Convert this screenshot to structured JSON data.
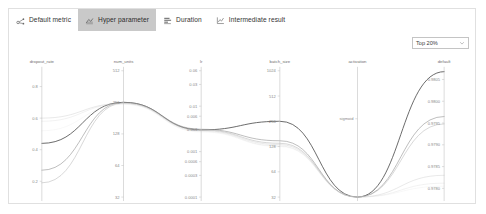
{
  "tabs": [
    {
      "label": "Default metric",
      "icon": "scatter-metric-icon",
      "selected": false
    },
    {
      "label": "Hyper parameter",
      "icon": "parallel-coordinates-icon",
      "selected": true
    },
    {
      "label": "Duration",
      "icon": "bar-duration-icon",
      "selected": false
    },
    {
      "label": "Intermediate result",
      "icon": "line-intermediate-icon",
      "selected": false
    }
  ],
  "filter": {
    "value": "Top 20%",
    "icon": "chevron-down-icon"
  },
  "chart_data": {
    "type": "line",
    "subtype": "parallel-coordinates",
    "title": "",
    "grid": false,
    "legend": null,
    "axes": [
      {
        "name": "dropout_rate",
        "scale": "linear",
        "ticks": [
          "0.8",
          "0.6",
          "0.4",
          "0.2"
        ],
        "tick_values": [
          0.8,
          0.6,
          0.4,
          0.2
        ],
        "range": [
          0.1,
          0.9
        ]
      },
      {
        "name": "num_units",
        "scale": "log2",
        "ticks": [
          "512",
          "256",
          "128",
          "64",
          "32"
        ],
        "tick_values": [
          512,
          256,
          128,
          64,
          32
        ],
        "range": [
          32,
          512
        ]
      },
      {
        "name": "lr",
        "scale": "log",
        "ticks": [
          "0.06",
          "0.03",
          "0.01",
          "0.006",
          "0.003",
          "0.001",
          "0.0006",
          "0.0003",
          "0.0001"
        ],
        "tick_values": [
          0.06,
          0.03,
          0.01,
          0.006,
          0.003,
          0.001,
          0.0006,
          0.0003,
          0.0001
        ],
        "range": [
          0.0001,
          0.06
        ]
      },
      {
        "name": "batch_size",
        "scale": "log2",
        "ticks": [
          "1024",
          "512",
          "256",
          "128",
          "64",
          "32"
        ],
        "tick_values": [
          1024,
          512,
          256,
          128,
          64,
          32
        ],
        "range": [
          32,
          1024
        ]
      },
      {
        "name": "activation",
        "scale": "category",
        "ticks": [
          "sigmoid"
        ],
        "categories": [
          "sigmoid"
        ],
        "range": [
          0,
          1
        ]
      },
      {
        "name": "default",
        "scale": "linear",
        "ticks": [
          "0.9805",
          "0.9800",
          "0.9795",
          "0.9790",
          "0.9785",
          "0.9780"
        ],
        "tick_values": [
          0.9805,
          0.98,
          0.9795,
          0.979,
          0.9785,
          0.978
        ],
        "range": [
          0.9778,
          0.9807
        ]
      }
    ],
    "series": [
      {
        "name": "trial-1",
        "shade": "#555555",
        "opacity": 0.92,
        "width": 0.95,
        "values": [
          0.44,
          256,
          0.003,
          256,
          "sigmoid",
          0.98068
        ]
      },
      {
        "name": "trial-2",
        "shade": "#8d8d8d",
        "opacity": 0.72,
        "width": 0.8,
        "values": [
          0.27,
          256,
          0.0031,
          150,
          "sigmoid",
          0.97965
        ]
      },
      {
        "name": "trial-3",
        "shade": "#a8a8a8",
        "opacity": 0.6,
        "width": 0.75,
        "values": [
          0.19,
          252,
          0.003,
          140,
          "sigmoid",
          0.97948
        ]
      },
      {
        "name": "trial-4",
        "shade": "#c0c0c0",
        "opacity": 0.5,
        "width": 0.7,
        "values": [
          0.6,
          250,
          0.0029,
          135,
          "sigmoid",
          0.9783
        ]
      },
      {
        "name": "trial-5",
        "shade": "#cfcfcf",
        "opacity": 0.42,
        "width": 0.65,
        "values": [
          0.58,
          248,
          0.0028,
          130,
          "sigmoid",
          0.97812
        ]
      },
      {
        "name": "trial-6",
        "shade": "#dcdcdc",
        "opacity": 0.35,
        "width": 0.6,
        "values": [
          0.52,
          245,
          0.0027,
          128,
          "sigmoid",
          0.97805
        ]
      }
    ]
  }
}
